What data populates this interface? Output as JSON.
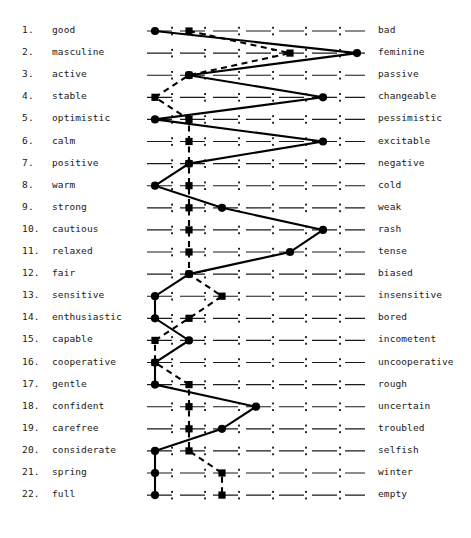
{
  "scale": {
    "points": 7,
    "tick_glyph": ":",
    "x_positions": [
      155,
      189,
      222,
      256,
      290,
      323,
      357
    ],
    "tick_x_positions": [
      172,
      205,
      239,
      273,
      306,
      340
    ],
    "row_y_start": 31,
    "row_spacing": 22.1
  },
  "legend": {
    "solid_series": "solid-line-circles",
    "dashed_series": "dashed-line-squares"
  },
  "chart_data": {
    "type": "line",
    "xlabel": "",
    "ylabel": "",
    "xlim": [
      1,
      7
    ],
    "grid": false,
    "legend_position": "none",
    "categories": [
      "good - bad",
      "masculine - feminine",
      "active - passive",
      "stable - changeable",
      "optimistic - pessimistic",
      "calm - excitable",
      "positive - negative",
      "warm - cold",
      "strong - weak",
      "cautious - rash",
      "relaxed - tense",
      "fair - biased",
      "sensitive - insensitive",
      "enthusiastic - bored",
      "capable - incometent",
      "cooperative - uncooperative",
      "gentle - rough",
      "confident - uncertain",
      "carefree - troubled",
      "considerate - selfish",
      "spring - winter",
      "full - empty"
    ],
    "series": [
      {
        "name": "solid-line-circles",
        "marker": "circle",
        "linestyle": "solid",
        "values": [
          1,
          7,
          2,
          6,
          1,
          6,
          2,
          1,
          3,
          6,
          5,
          2,
          1,
          1,
          2,
          1,
          1,
          4,
          3,
          1,
          1,
          1
        ]
      },
      {
        "name": "dashed-line-squares",
        "marker": "square",
        "linestyle": "dashed",
        "values": [
          2,
          5,
          2,
          1,
          2,
          2,
          2,
          2,
          2,
          2,
          2,
          2,
          3,
          2,
          1,
          1,
          2,
          2,
          2,
          2,
          3,
          3
        ]
      }
    ]
  },
  "rows": [
    {
      "num": "1.",
      "left": "good",
      "right": "bad"
    },
    {
      "num": "2.",
      "left": "masculine",
      "right": "feminine"
    },
    {
      "num": "3.",
      "left": "active",
      "right": "passive"
    },
    {
      "num": "4.",
      "left": "stable",
      "right": "changeable"
    },
    {
      "num": "5.",
      "left": "optimistic",
      "right": "pessimistic"
    },
    {
      "num": "6.",
      "left": "calm",
      "right": "excitable"
    },
    {
      "num": "7.",
      "left": "positive",
      "right": "negative"
    },
    {
      "num": "8.",
      "left": "warm",
      "right": "cold"
    },
    {
      "num": "9.",
      "left": "strong",
      "right": "weak"
    },
    {
      "num": "10.",
      "left": "cautious",
      "right": "rash"
    },
    {
      "num": "11.",
      "left": "relaxed",
      "right": "tense"
    },
    {
      "num": "12.",
      "left": "fair",
      "right": "biased"
    },
    {
      "num": "13.",
      "left": "sensitive",
      "right": "insensitive"
    },
    {
      "num": "14.",
      "left": "enthusiastic",
      "right": "bored"
    },
    {
      "num": "15.",
      "left": "capable",
      "right": "incometent"
    },
    {
      "num": "16.",
      "left": "cooperative",
      "right": "uncooperative"
    },
    {
      "num": "17.",
      "left": "gentle",
      "right": "rough"
    },
    {
      "num": "18.",
      "left": "confident",
      "right": "uncertain"
    },
    {
      "num": "19.",
      "left": "carefree",
      "right": "troubled"
    },
    {
      "num": "20.",
      "left": "considerate",
      "right": "selfish"
    },
    {
      "num": "21.",
      "left": "spring",
      "right": "winter"
    },
    {
      "num": "22.",
      "left": "full",
      "right": "empty"
    }
  ],
  "colors": {
    "ink": "#000000",
    "paper": "#ffffff",
    "text": "#181818"
  }
}
